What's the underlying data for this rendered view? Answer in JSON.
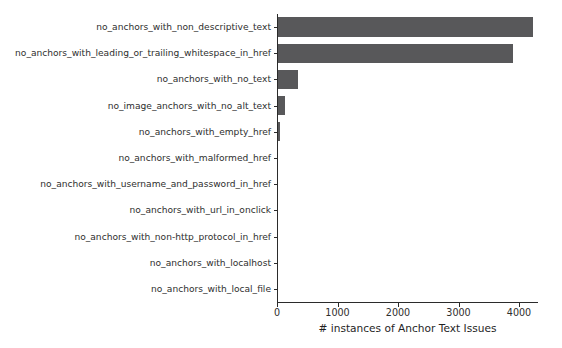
{
  "chart_data": {
    "type": "bar",
    "orientation": "horizontal",
    "title": "",
    "xlabel": "# instances of Anchor Text Issues",
    "ylabel": "",
    "xlim": [
      0,
      4300
    ],
    "ylim": [
      0,
      11
    ],
    "grid": false,
    "legend": null,
    "bar_color": "#58585a",
    "categories": [
      "no_anchors_with_non_descriptive_text",
      "no_anchors_with_leading_or_trailing_whitespace_in_href",
      "no_anchors_with_no_text",
      "no_image_anchors_with_no_alt_text",
      "no_anchors_with_empty_href",
      "no_anchors_with_malformed_href",
      "no_anchors_with_username_and_password_in_href",
      "no_anchors_with_url_in_onclick",
      "no_anchors_with_non-http_protocol_in_href",
      "no_anchors_with_localhost",
      "no_anchors_with_local_file"
    ],
    "values": [
      4230,
      3900,
      350,
      130,
      50,
      15,
      0,
      0,
      0,
      0,
      0
    ],
    "xticks": [
      0,
      1000,
      2000,
      3000,
      4000
    ],
    "xtick_labels": [
      "0",
      "1000",
      "2000",
      "3000",
      "4000"
    ]
  },
  "axes": {
    "spine_color": "#2b2b2b",
    "background": "#ffffff"
  }
}
